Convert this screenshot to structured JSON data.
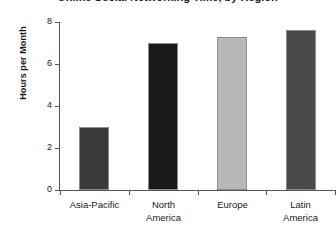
{
  "chart_data": {
    "type": "bar",
    "title": "Online Social Networking Time, by Region",
    "xlabel": "",
    "ylabel": "Hours per Month",
    "categories": [
      "Asia-Pacific",
      "North America",
      "Europe",
      "Latin America"
    ],
    "values": [
      3.0,
      7.0,
      7.3,
      7.6
    ],
    "bar_colors": [
      "#3a3a3a",
      "#1a1a1a",
      "#b8b8b8",
      "#4a4a4a"
    ],
    "ylim": [
      0,
      8
    ],
    "yticks": [
      0,
      2,
      4,
      6,
      8
    ],
    "ytick_labels": [
      "0",
      "2",
      "4",
      "6",
      "8"
    ],
    "grid": false,
    "legend": false
  }
}
